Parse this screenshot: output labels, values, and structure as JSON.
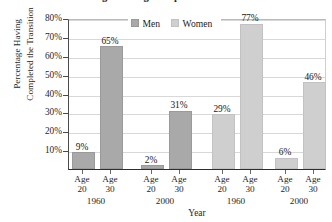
{
  "chart_data": {
    "type": "bar",
    "title": "Percentage Having Completed the Transition",
    "xlabel": "Year",
    "ylabel_line1": "Percentage Having",
    "ylabel_line2": "Completed the Transition",
    "ylim": [
      0,
      80
    ],
    "ytick_labels": [
      "80%",
      "70%",
      "60%",
      "50%",
      "40%",
      "30%",
      "20%",
      "10%"
    ],
    "ytick_values": [
      80,
      70,
      60,
      50,
      40,
      30,
      20,
      10
    ],
    "grid": true,
    "legend_position": "top-center",
    "legend": [
      {
        "name": "Men",
        "color": "#a9a9a9"
      },
      {
        "name": "Women",
        "color": "#cfcfcf"
      }
    ],
    "categories": [
      "Age 20 (1960)",
      "Age 30 (1960)",
      "Age 20 (2000)",
      "Age 30 (2000)",
      "Age 20 (1960)",
      "Age 30 (1960)",
      "Age 20 (2000)",
      "Age 30 (2000)"
    ],
    "values": [
      9,
      65,
      2,
      31,
      29,
      77,
      6,
      46
    ],
    "data_labels": [
      "9%",
      "65%",
      "2%",
      "31%",
      "29%",
      "77%",
      "6%",
      "46%"
    ],
    "bars": [
      {
        "series": "Men",
        "age": "20",
        "year": "1960",
        "value": 9,
        "label": "9%",
        "color": "#a9a9a9"
      },
      {
        "series": "Men",
        "age": "30",
        "year": "1960",
        "value": 65,
        "label": "65%",
        "color": "#a9a9a9"
      },
      {
        "series": "Men",
        "age": "20",
        "year": "2000",
        "value": 2,
        "label": "2%",
        "color": "#a9a9a9"
      },
      {
        "series": "Men",
        "age": "30",
        "year": "2000",
        "value": 31,
        "label": "31%",
        "color": "#a9a9a9"
      },
      {
        "series": "Women",
        "age": "20",
        "year": "1960",
        "value": 29,
        "label": "29%",
        "color": "#cfcfcf"
      },
      {
        "series": "Women",
        "age": "30",
        "year": "1960",
        "value": 77,
        "label": "77%",
        "color": "#cfcfcf"
      },
      {
        "series": "Women",
        "age": "20",
        "year": "2000",
        "value": 6,
        "label": "6%",
        "color": "#cfcfcf"
      },
      {
        "series": "Women",
        "age": "30",
        "year": "2000",
        "value": 46,
        "label": "46%",
        "color": "#cfcfcf"
      }
    ],
    "groups": [
      {
        "year": "1960",
        "age_prefix": "Age",
        "ages": [
          "20",
          "30"
        ]
      },
      {
        "year": "2000",
        "age_prefix": "Age",
        "ages": [
          "20",
          "30"
        ]
      },
      {
        "year": "1960",
        "age_prefix": "Age",
        "ages": [
          "20",
          "30"
        ]
      },
      {
        "year": "2000",
        "age_prefix": "Age",
        "ages": [
          "20",
          "30"
        ]
      }
    ],
    "age_prefix": "Age"
  }
}
